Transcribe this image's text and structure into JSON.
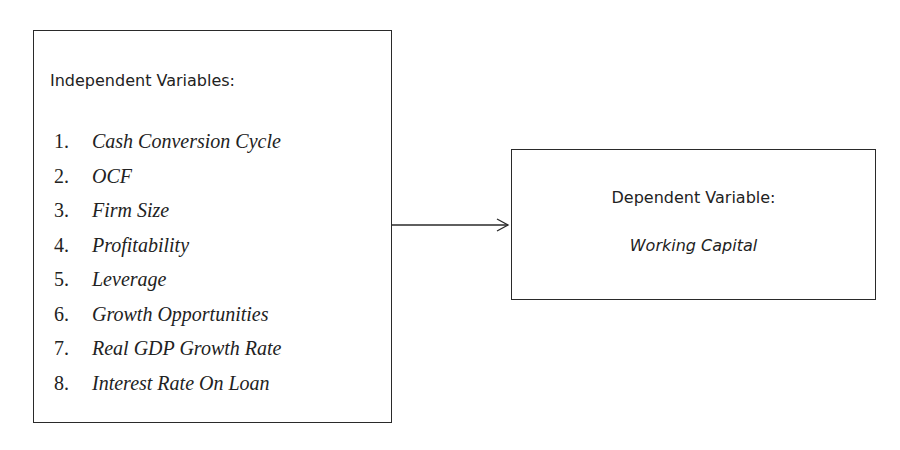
{
  "independent": {
    "heading": "Independent Variables:",
    "items": [
      {
        "num": "1.",
        "label": "Cash Conversion Cycle"
      },
      {
        "num": "2.",
        "label": "OCF"
      },
      {
        "num": "3.",
        "label": "Firm Size"
      },
      {
        "num": "4.",
        "label": "Profitability"
      },
      {
        "num": "5.",
        "label": "Leverage"
      },
      {
        "num": "6.",
        "label": "Growth Opportunities"
      },
      {
        "num": "7.",
        "label": "Real GDP Growth Rate"
      },
      {
        "num": "8.",
        "label": "Interest Rate On Loan"
      }
    ]
  },
  "dependent": {
    "heading": "Dependent Variable:",
    "value": "Working Capital"
  },
  "arrow": {
    "from": "independent",
    "to": "dependent",
    "color": "#2a2a2a"
  }
}
